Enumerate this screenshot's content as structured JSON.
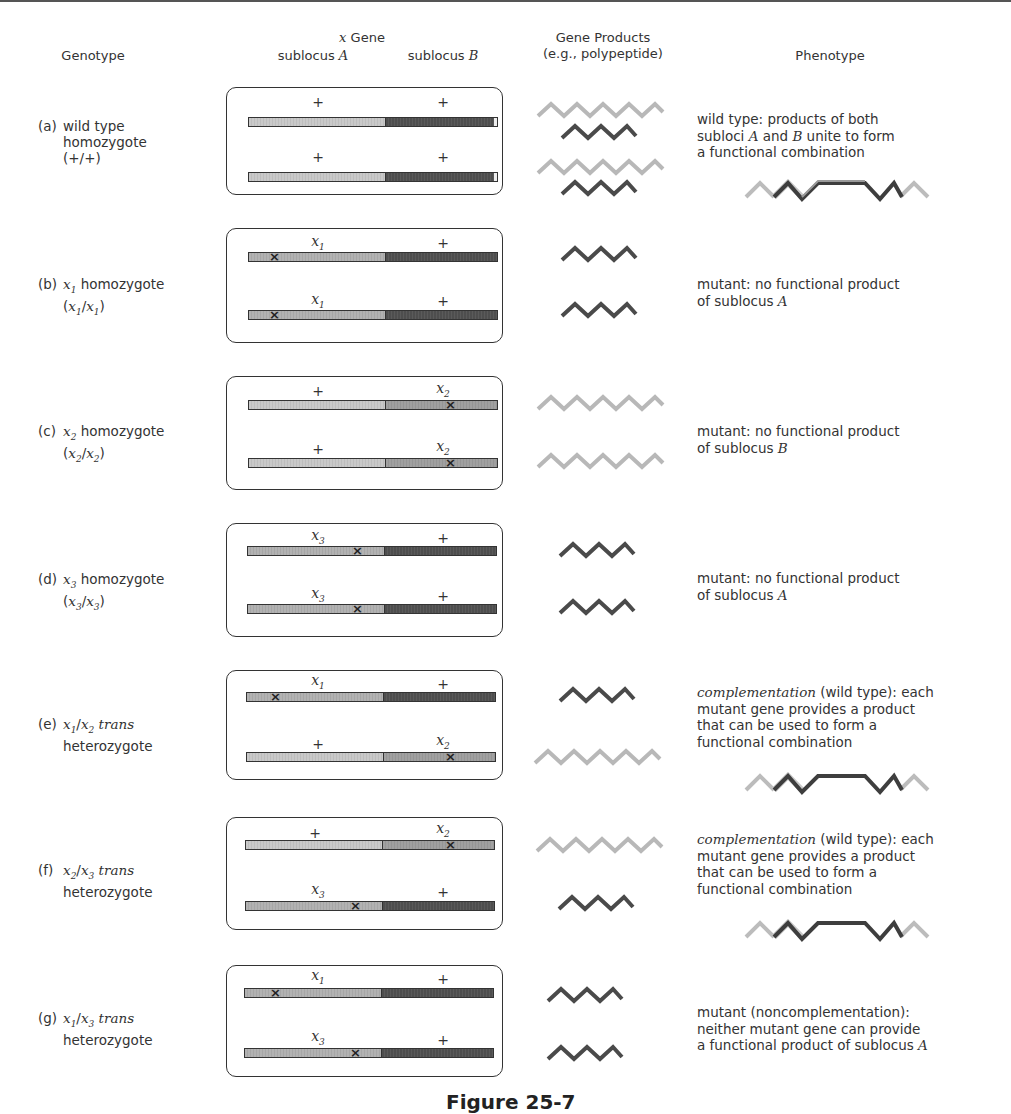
{
  "headers": {
    "genotype": "Genotype",
    "x_gene": "x Gene",
    "sublocus_a": "sublocus A",
    "sublocus_b": "sublocus B",
    "gene_products_line1": "Gene Products",
    "gene_products_line2": "(e.g., polypeptide)",
    "phenotype": "Phenotype"
  },
  "colors": {
    "product_a": "#b8b8b8",
    "product_b": "#4a4a4a",
    "segment_a": "#c9c9c9",
    "segment_a_mutant": "#b0b0b0",
    "segment_b": "#505050",
    "segment_b_mutant": "#a0a0a0"
  },
  "rows": [
    {
      "letter": "(a)",
      "genotype_line1": "wild type",
      "genotype_line2": "homozygote",
      "genotype_line3": "(+/+)",
      "chromosome1": {
        "a_label": "+",
        "b_label": "+",
        "mutation": "none"
      },
      "chromosome2": {
        "a_label": "+",
        "b_label": "+",
        "mutation": "none"
      },
      "products": [
        "A",
        "B",
        "A",
        "B"
      ],
      "phenotype": [
        "wild type:  products of both",
        "subloci A and B unite to form",
        "a functional combination"
      ],
      "combined_product": true
    },
    {
      "letter": "(b)",
      "genotype_line1": "x1 homozygote",
      "genotype_line2": "(x1/x1)",
      "chromosome1": {
        "a_label": "x1",
        "b_label": "+",
        "mutation": "x1"
      },
      "chromosome2": {
        "a_label": "x1",
        "b_label": "+",
        "mutation": "x1"
      },
      "products": [
        "B",
        "B"
      ],
      "phenotype": [
        "mutant:  no functional product",
        "of sublocus A"
      ],
      "combined_product": false
    },
    {
      "letter": "(c)",
      "genotype_line1": "x2 homozygote",
      "genotype_line2": "(x2/x2)",
      "chromosome1": {
        "a_label": "+",
        "b_label": "x2",
        "mutation": "x2"
      },
      "chromosome2": {
        "a_label": "+",
        "b_label": "x2",
        "mutation": "x2"
      },
      "products": [
        "A",
        "A"
      ],
      "phenotype": [
        "mutant:  no functional product",
        "of sublocus B"
      ],
      "combined_product": false
    },
    {
      "letter": "(d)",
      "genotype_line1": "x3 homozygote",
      "genotype_line2": "(x3/x3)",
      "chromosome1": {
        "a_label": "x3",
        "b_label": "+",
        "mutation": "x3"
      },
      "chromosome2": {
        "a_label": "x3",
        "b_label": "+",
        "mutation": "x3"
      },
      "products": [
        "B",
        "B"
      ],
      "phenotype": [
        "mutant:  no functional product",
        "of sublocus A"
      ],
      "combined_product": false
    },
    {
      "letter": "(e)",
      "genotype_line1": "x1/x2 trans",
      "genotype_line2": "heterozygote",
      "chromosome1": {
        "a_label": "x1",
        "b_label": "+",
        "mutation": "x1"
      },
      "chromosome2": {
        "a_label": "+",
        "b_label": "x2",
        "mutation": "x2"
      },
      "products": [
        "B",
        "A"
      ],
      "phenotype": [
        "complementation (wild type):  each",
        "mutant gene provides a product",
        "that can be used to form a",
        "functional combination"
      ],
      "combined_product": true
    },
    {
      "letter": "(f)",
      "genotype_line1": "x2/x3 trans",
      "genotype_line2": "heterozygote",
      "chromosome1": {
        "a_label": "+",
        "b_label": "x2",
        "mutation": "x2"
      },
      "chromosome2": {
        "a_label": "x3",
        "b_label": "+",
        "mutation": "x3"
      },
      "products": [
        "A",
        "B"
      ],
      "phenotype": [
        "complementation (wild type):  each",
        "mutant gene provides a product",
        "that can be used to form a",
        "functional combination"
      ],
      "combined_product": true
    },
    {
      "letter": "(g)",
      "genotype_line1": "x1/x3 trans",
      "genotype_line2": "heterozygote",
      "chromosome1": {
        "a_label": "x1",
        "b_label": "+",
        "mutation": "x1"
      },
      "chromosome2": {
        "a_label": "x3",
        "b_label": "+",
        "mutation": "x3"
      },
      "products": [
        "B",
        "B"
      ],
      "phenotype": [
        "mutant (noncomplementation):",
        "neither mutant gene can provide",
        "a functional product of sublocus A"
      ],
      "combined_product": false
    }
  ],
  "caption": "Figure 25-7"
}
